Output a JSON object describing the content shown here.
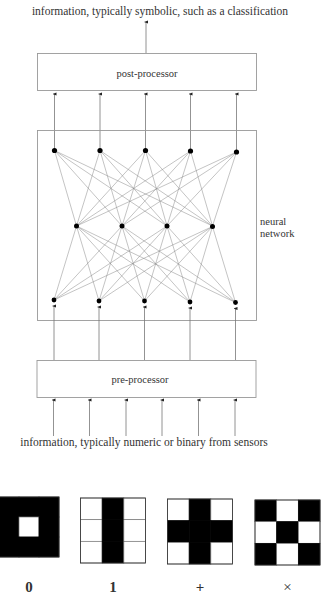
{
  "diagram": {
    "output_label": "information, typically symbolic, such as a classification",
    "post_processor_label": "post-processor",
    "pre_processor_label": "pre-processor",
    "network_label_line1": "neural",
    "network_label_line2": "network",
    "input_label": "information, typically numeric or binary from sensors",
    "layers": {
      "output_nodes": 5,
      "hidden_nodes": 4,
      "input_nodes": 5,
      "sensor_inputs": 6
    },
    "colors": {
      "line": "#777777",
      "node": "#000000",
      "box": "#999999"
    }
  },
  "patterns": [
    {
      "label": "0",
      "grid": [
        [
          1,
          1,
          1
        ],
        [
          1,
          0,
          1
        ],
        [
          1,
          1,
          1
        ]
      ]
    },
    {
      "label": "1",
      "grid": [
        [
          0,
          1,
          0
        ],
        [
          0,
          1,
          0
        ],
        [
          0,
          1,
          0
        ]
      ]
    },
    {
      "label": "+",
      "grid": [
        [
          0,
          1,
          0
        ],
        [
          1,
          1,
          1
        ],
        [
          0,
          1,
          0
        ]
      ]
    },
    {
      "label": "×",
      "grid": [
        [
          1,
          0,
          1
        ],
        [
          0,
          1,
          0
        ],
        [
          1,
          0,
          1
        ]
      ]
    }
  ]
}
